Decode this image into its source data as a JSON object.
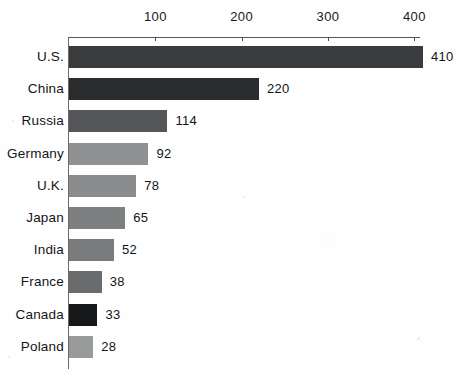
{
  "chart_data": {
    "type": "bar",
    "orientation": "horizontal",
    "title": "",
    "subtitle": "",
    "xlabel": "",
    "ylabel": "",
    "categories": [
      "U.S.",
      "China",
      "Russia",
      "Germany",
      "U.K.",
      "Japan",
      "India",
      "France",
      "Canada",
      "Poland"
    ],
    "values": [
      410,
      220,
      114,
      92,
      78,
      65,
      52,
      38,
      33,
      28
    ],
    "value_labels": [
      "410",
      "220",
      "114",
      "92",
      "78",
      "65",
      "52",
      "38",
      "33",
      "28"
    ],
    "xlim": [
      0,
      410
    ],
    "xticks": [
      100,
      200,
      300,
      400
    ],
    "xtick_labels": [
      "100",
      "200",
      "300",
      "400"
    ],
    "axis_position": "top",
    "grid": false,
    "legend": "none",
    "bar_colors": [
      "#3a3b3d",
      "#2a2b2d",
      "#555659",
      "#909193",
      "#8b8c8e",
      "#7e7f81",
      "#7a7b7d",
      "#6a6b6d",
      "#17181a",
      "#999a9c"
    ]
  },
  "axis": {
    "line_color": "#55565a"
  }
}
